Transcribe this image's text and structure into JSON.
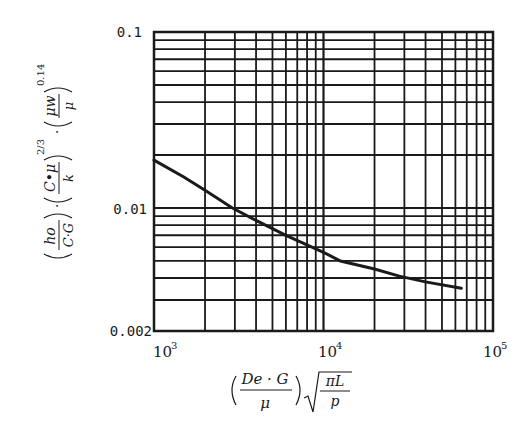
{
  "chart_data": {
    "type": "line",
    "title": "",
    "xlabel": "(De·G/μ)·√(πL/p)",
    "ylabel": "(ho/(C·G))·(C·μ/k)^(2/3)·(μw/μ)^0.14",
    "x_scale": "log",
    "y_scale": "log",
    "xlim": [
      1000,
      100000
    ],
    "ylim": [
      0.002,
      0.1
    ],
    "grid": true,
    "legend": null,
    "x_ticks": [
      {
        "value": 1000,
        "base": "10",
        "exp": "3"
      },
      {
        "value": 10000,
        "base": "10",
        "exp": "4"
      },
      {
        "value": 100000,
        "base": "10",
        "exp": "5"
      }
    ],
    "y_ticks": [
      {
        "value": 0.1,
        "label": "0.1"
      },
      {
        "value": 0.01,
        "label": "0.01"
      },
      {
        "value": 0.002,
        "label": "0.002"
      }
    ],
    "x_gridlines": [
      1000,
      2000,
      3000,
      4000,
      5000,
      6000,
      7000,
      8000,
      9000,
      10000,
      20000,
      30000,
      40000,
      50000,
      60000,
      70000,
      80000,
      90000,
      100000
    ],
    "y_gridlines": [
      0.002,
      0.003,
      0.004,
      0.005,
      0.006,
      0.007,
      0.008,
      0.009,
      0.01,
      0.02,
      0.03,
      0.04,
      0.05,
      0.06,
      0.07,
      0.08,
      0.09,
      0.1
    ],
    "series": [
      {
        "name": "j-factor curve",
        "x": [
          1000,
          1500,
          2000,
          2900,
          4000,
          6000,
          10000,
          12600,
          20000,
          28000,
          40000,
          65000
        ],
        "y": [
          0.0187,
          0.015,
          0.0126,
          0.01,
          0.0085,
          0.007,
          0.0056,
          0.005,
          0.0045,
          0.0041,
          0.0038,
          0.0035
        ]
      }
    ]
  },
  "labels": {
    "y_tick_top": "0.1",
    "y_tick_mid": "0.01",
    "y_tick_bottom": "0.002",
    "x_tick_base": "10",
    "x_tick_exp_1": "3",
    "x_tick_exp_2": "4",
    "x_tick_exp_3": "5",
    "xlabel": {
      "num": "De · G",
      "num_sub": "e",
      "den": "μ",
      "sqrt_num": "πL",
      "sqrt_den": "p"
    },
    "ylabel": {
      "f1_num": "ho",
      "f1_den": "C·G",
      "f2_num": "C•μ",
      "f2_den": "k",
      "f2_exp": "2/3",
      "f3_num": "μw",
      "f3_den": "μ",
      "f3_exp": "0.14"
    }
  }
}
